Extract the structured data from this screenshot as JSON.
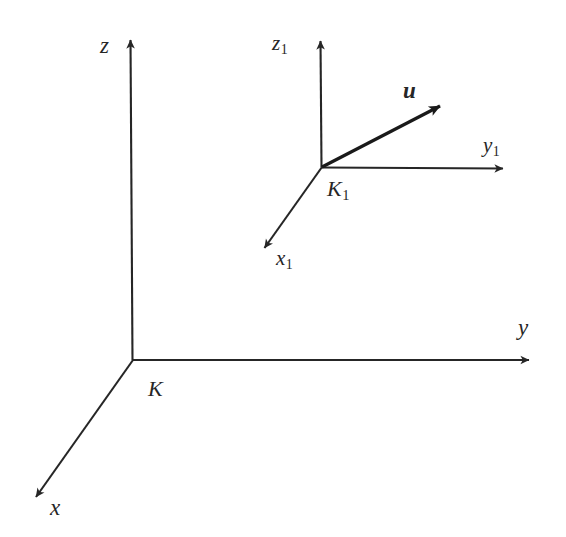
{
  "figure": {
    "background_color": "#ffffff",
    "stroke_color": "#262626",
    "vector_color": "#1a1a1a"
  },
  "frames": {
    "main": {
      "origin_label": "K",
      "axes": [
        {
          "name": "x",
          "label": "x",
          "direction": "down-left"
        },
        {
          "name": "y",
          "label": "y",
          "direction": "right"
        },
        {
          "name": "z",
          "label": "z",
          "direction": "up"
        }
      ]
    },
    "secondary": {
      "origin_label": "K",
      "origin_subscript": "1",
      "axes": [
        {
          "name": "x1",
          "label": "x",
          "subscript": "1",
          "direction": "down-left"
        },
        {
          "name": "y1",
          "label": "y",
          "subscript": "1",
          "direction": "right"
        },
        {
          "name": "z1",
          "label": "z",
          "subscript": "1",
          "direction": "up"
        }
      ]
    }
  },
  "vector": {
    "label": "u",
    "style": "bold-italic",
    "from": "K1",
    "direction": "up-right"
  },
  "geometry": {
    "main_origin": [
      133,
      360
    ],
    "main_x_tip": [
      29,
      504
    ],
    "main_y_tip": [
      537,
      360
    ],
    "main_z_tip": [
      130,
      32
    ],
    "sub_origin": [
      322,
      167
    ],
    "sub_x_tip": [
      258,
      257
    ],
    "sub_y_tip": [
      510,
      169
    ],
    "sub_z_tip": [
      320,
      33
    ],
    "vector_tip": [
      447,
      101
    ]
  }
}
